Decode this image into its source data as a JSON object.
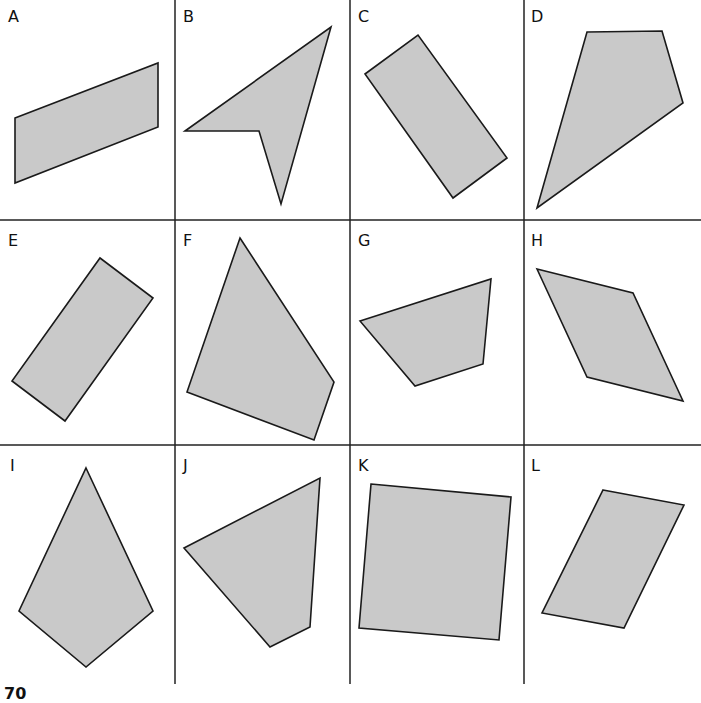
{
  "figure": {
    "colors": {
      "shape_fill": "#c9c9c9",
      "shape_stroke": "#1a1a1a",
      "grid": "#222222",
      "background": "#ffffff"
    },
    "grid": {
      "columns": 4,
      "rows": 3,
      "vertical_lines_x": [
        175,
        350,
        524
      ],
      "horizontal_lines_y": [
        220,
        445
      ],
      "bottom_y": 684
    },
    "cells": [
      {
        "label": "A",
        "label_pos": [
          8,
          22
        ],
        "points": [
          [
            15,
            118
          ],
          [
            158,
            63
          ],
          [
            158,
            127
          ],
          [
            15,
            183
          ]
        ]
      },
      {
        "label": "B",
        "label_pos": [
          183,
          22
        ],
        "points": [
          [
            185,
            131
          ],
          [
            331,
            27
          ],
          [
            281,
            204
          ],
          [
            259,
            131
          ]
        ]
      },
      {
        "label": "C",
        "label_pos": [
          358,
          22
        ],
        "points": [
          [
            365,
            74
          ],
          [
            418,
            35
          ],
          [
            507,
            158
          ],
          [
            453,
            198
          ]
        ]
      },
      {
        "label": "D",
        "label_pos": [
          531,
          22
        ],
        "points": [
          [
            587,
            32
          ],
          [
            662,
            31
          ],
          [
            683,
            103
          ],
          [
            537,
            208
          ]
        ]
      },
      {
        "label": "E",
        "label_pos": [
          8,
          246
        ],
        "points": [
          [
            100,
            258
          ],
          [
            153,
            298
          ],
          [
            65,
            421
          ],
          [
            12,
            381
          ]
        ]
      },
      {
        "label": "F",
        "label_pos": [
          183,
          246
        ],
        "points": [
          [
            240,
            238
          ],
          [
            334,
            382
          ],
          [
            314,
            440
          ],
          [
            187,
            392
          ]
        ]
      },
      {
        "label": "G",
        "label_pos": [
          358,
          246
        ],
        "points": [
          [
            360,
            321
          ],
          [
            491,
            279
          ],
          [
            483,
            364
          ],
          [
            415,
            386
          ]
        ]
      },
      {
        "label": "H",
        "label_pos": [
          531,
          246
        ],
        "points": [
          [
            537,
            269
          ],
          [
            633,
            293
          ],
          [
            683,
            401
          ],
          [
            587,
            377
          ]
        ]
      },
      {
        "label": "I",
        "label_pos": [
          10,
          471
        ],
        "points": [
          [
            86,
            468
          ],
          [
            153,
            611
          ],
          [
            86,
            667
          ],
          [
            19,
            611
          ]
        ]
      },
      {
        "label": "J",
        "label_pos": [
          183,
          471
        ],
        "points": [
          [
            184,
            548
          ],
          [
            320,
            478
          ],
          [
            310,
            627
          ],
          [
            270,
            647
          ]
        ]
      },
      {
        "label": "K",
        "label_pos": [
          358,
          471
        ],
        "points": [
          [
            371,
            484
          ],
          [
            511,
            497
          ],
          [
            499,
            640
          ],
          [
            359,
            628
          ]
        ]
      },
      {
        "label": "L",
        "label_pos": [
          531,
          471
        ],
        "points": [
          [
            603,
            490
          ],
          [
            684,
            505
          ],
          [
            624,
            628
          ],
          [
            542,
            613
          ]
        ]
      }
    ],
    "page_number": "70"
  }
}
